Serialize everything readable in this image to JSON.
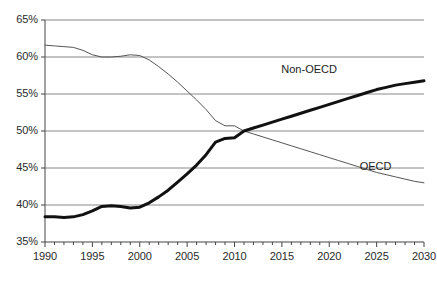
{
  "chart_data": {
    "type": "line",
    "title": "",
    "subtitle": "",
    "xlabel": "",
    "ylabel": "",
    "xlim": [
      1990,
      2030
    ],
    "ylim": [
      35,
      65
    ],
    "grid": true,
    "grid_axis": "y",
    "legend": "inline-annotations",
    "y_tick_labels": [
      "65%",
      "60%",
      "55%",
      "50%",
      "45%",
      "40%",
      "35%"
    ],
    "y_tick_values": [
      65,
      60,
      55,
      50,
      45,
      40,
      35
    ],
    "x_tick_labels": [
      "1990",
      "1995",
      "2000",
      "2005",
      "2010",
      "2015",
      "2020",
      "2025",
      "2030"
    ],
    "x_tick_values": [
      1990,
      1995,
      2000,
      2005,
      2010,
      2015,
      2020,
      2025,
      2030
    ],
    "x_minor_tick_step": 1,
    "x": [
      1990,
      1991,
      1992,
      1993,
      1994,
      1995,
      1996,
      1997,
      1998,
      1999,
      2000,
      2001,
      2002,
      2003,
      2004,
      2005,
      2006,
      2007,
      2008,
      2009,
      2010,
      2011,
      2012,
      2013,
      2014,
      2015,
      2016,
      2017,
      2018,
      2019,
      2020,
      2021,
      2022,
      2023,
      2024,
      2025,
      2026,
      2027,
      2028,
      2029,
      2030
    ],
    "series": [
      {
        "name": "OECD",
        "label": "OECD",
        "color": "#555555",
        "linewidth": 1,
        "label_x": 2025,
        "label_y": 45.2,
        "values": [
          61.6,
          61.5,
          61.4,
          61.3,
          60.9,
          60.3,
          60.0,
          60.0,
          60.1,
          60.3,
          60.2,
          59.6,
          58.7,
          57.7,
          56.6,
          55.4,
          54.2,
          52.9,
          51.4,
          50.7,
          50.7,
          50.0,
          49.6,
          49.2,
          48.8,
          48.4,
          48.0,
          47.6,
          47.2,
          46.8,
          46.4,
          46.0,
          45.6,
          45.2,
          44.8,
          44.4,
          44.1,
          43.8,
          43.5,
          43.2,
          43.0
        ]
      },
      {
        "name": "Non-OECD",
        "label": "Non-OECD",
        "color": "#111111",
        "linewidth": 3,
        "label_x": 2018,
        "label_y": 58.2,
        "values": [
          38.4,
          38.4,
          38.3,
          38.4,
          38.7,
          39.2,
          39.8,
          39.9,
          39.8,
          39.6,
          39.7,
          40.3,
          41.1,
          42.0,
          43.1,
          44.2,
          45.4,
          46.8,
          48.5,
          49.0,
          49.1,
          50.0,
          50.4,
          50.8,
          51.2,
          51.6,
          52.0,
          52.4,
          52.8,
          53.2,
          53.6,
          54.0,
          54.4,
          54.8,
          55.2,
          55.6,
          55.9,
          56.2,
          56.4,
          56.6,
          56.8
        ]
      }
    ],
    "crossing": {
      "year": 2011,
      "value": 50.0
    },
    "axis": {
      "left_color": "#444444",
      "bottom_color": "#444444",
      "grid_color": "#888888"
    }
  },
  "axis_labels": {
    "y": [
      {
        "text": "65%"
      },
      {
        "text": "60%"
      },
      {
        "text": "55%"
      },
      {
        "text": "50%"
      },
      {
        "text": "45%"
      },
      {
        "text": "40%"
      },
      {
        "text": "35%"
      }
    ],
    "x": [
      {
        "text": "1990"
      },
      {
        "text": "1995"
      },
      {
        "text": "2000"
      },
      {
        "text": "2005"
      },
      {
        "text": "2010"
      },
      {
        "text": "2015"
      },
      {
        "text": "2020"
      },
      {
        "text": "2025"
      },
      {
        "text": "2030"
      }
    ]
  },
  "annotations": {
    "non_oecd": "Non-OECD",
    "oecd": "OECD"
  }
}
